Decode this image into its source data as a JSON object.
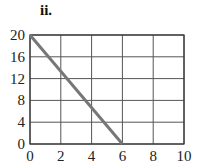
{
  "figure_label": "ii.",
  "chart_data": {
    "type": "line",
    "title": "",
    "label": "ii.",
    "xlabel": "",
    "ylabel": "",
    "xlim": [
      0,
      10
    ],
    "ylim": [
      0,
      20
    ],
    "xticks": [
      0,
      2,
      4,
      6,
      8,
      10
    ],
    "yticks": [
      0,
      4,
      8,
      12,
      16,
      20
    ],
    "grid": true,
    "legend": null,
    "series": [
      {
        "name": "line",
        "x": [
          0,
          6
        ],
        "y": [
          20,
          0
        ],
        "color": "#777777"
      }
    ]
  }
}
